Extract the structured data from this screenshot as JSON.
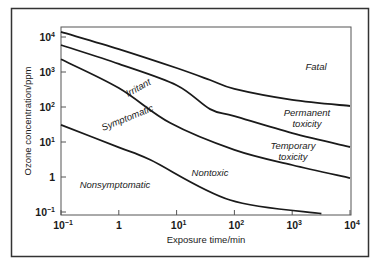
{
  "chart_data": {
    "type": "line",
    "title": "",
    "xlabel": "Exposure time/min",
    "ylabel": "Ozone concentration/ppm",
    "xscale": "log",
    "yscale": "log",
    "xlim": [
      0.1,
      10000
    ],
    "ylim": [
      0.1,
      10000
    ],
    "grid": false,
    "legend": null,
    "x_ticks": [
      {
        "value": 0.1,
        "base": "10",
        "exp": "−1"
      },
      {
        "value": 1,
        "base": "1",
        "exp": ""
      },
      {
        "value": 10,
        "base": "10",
        "exp": "1"
      },
      {
        "value": 100,
        "base": "10",
        "exp": "2"
      },
      {
        "value": 1000,
        "base": "10",
        "exp": "3"
      },
      {
        "value": 10000,
        "base": "10",
        "exp": "4"
      }
    ],
    "y_ticks": [
      {
        "value": 0.1,
        "base": "10",
        "exp": "−1"
      },
      {
        "value": 1,
        "base": "1",
        "exp": ""
      },
      {
        "value": 10,
        "base": "10",
        "exp": "1"
      },
      {
        "value": 100,
        "base": "10",
        "exp": "2"
      },
      {
        "value": 1000,
        "base": "10",
        "exp": "3"
      },
      {
        "value": 10000,
        "base": "10",
        "exp": "4"
      }
    ],
    "series": [
      {
        "name": "Fatal boundary",
        "x": [
          0.1,
          1,
          10,
          38,
          100,
          1000,
          10000
        ],
        "y": [
          14000,
          4500,
          1300,
          590,
          330,
          160,
          107
        ]
      },
      {
        "name": "Permanent toxicity boundary",
        "x": [
          0.1,
          1,
          10,
          38,
          100,
          1000,
          10000
        ],
        "y": [
          5900,
          1700,
          420,
          87,
          55,
          18,
          7.2
        ]
      },
      {
        "name": "Temporary toxicity / Irritant boundary",
        "x": [
          0.1,
          1,
          7.8,
          100,
          1000,
          10000
        ],
        "y": [
          2300,
          350,
          35,
          6,
          2.2,
          0.93
        ]
      },
      {
        "name": "Symptomatic boundary",
        "x": [
          0.1,
          1,
          3.5,
          84,
          3200
        ],
        "y": [
          31,
          7,
          3.1,
          0.22,
          0.09
        ]
      }
    ],
    "annotations": [
      {
        "text": "Fatal",
        "x": 2500,
        "y": 700
      },
      {
        "text": "Permanent toxicity",
        "x": 2500,
        "y": 40
      },
      {
        "text": "Temporary toxicity",
        "x": 2000,
        "y": 3
      },
      {
        "text": "Irritant",
        "x": 30,
        "y": 150,
        "rotation": -35
      },
      {
        "text": "Symptomatic",
        "x": 1.2,
        "y": 12,
        "rotation": -28
      },
      {
        "text": "Nontoxic",
        "x": 60,
        "y": 1.3
      },
      {
        "text": "Nonsymptomatic",
        "x": 1,
        "y": 0.9
      }
    ]
  }
}
